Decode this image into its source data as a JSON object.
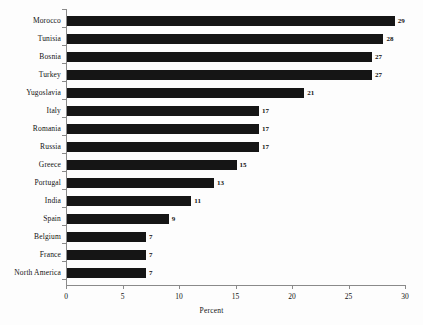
{
  "chart_data": {
    "type": "bar",
    "orientation": "horizontal",
    "title": "",
    "xlabel": "Percent",
    "ylabel": "",
    "xlim": [
      0,
      30
    ],
    "xticks": [
      0,
      5,
      10,
      15,
      20,
      25,
      30
    ],
    "grid": false,
    "legend": false,
    "bar_color": "#151515",
    "background_color": "#fdfdfd",
    "axis_color": "#8a8a8a",
    "categories": [
      "Morocco",
      "Tunisia",
      "Bosnia",
      "Turkey",
      "Yugoslavia",
      "Italy",
      "Romania",
      "Russia",
      "Greece",
      "Portugal",
      "India",
      "Spain",
      "Belgium",
      "France",
      "North America"
    ],
    "values": [
      29,
      28,
      27,
      27,
      21,
      17,
      17,
      17,
      15,
      13,
      11,
      9,
      7,
      7,
      7
    ],
    "value_labels": [
      "29",
      "28",
      "27",
      "27",
      "21",
      "17",
      "17",
      "17",
      "15",
      "13",
      "11",
      "9",
      "7",
      "7",
      "7"
    ],
    "xtick_labels": [
      "0",
      "5",
      "10",
      "15",
      "20",
      "25",
      "30"
    ]
  }
}
